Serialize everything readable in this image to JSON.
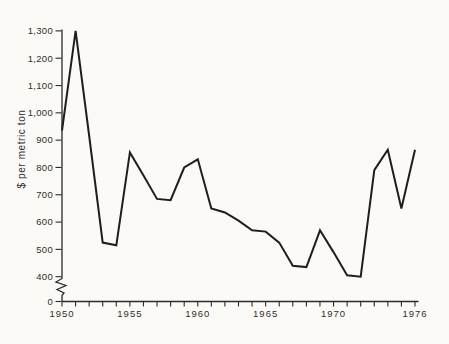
{
  "chart_data": {
    "type": "line",
    "title": "",
    "xlabel": "",
    "ylabel": "$ per metric ton",
    "x": [
      1950,
      1951,
      1952,
      1953,
      1954,
      1955,
      1956,
      1957,
      1958,
      1959,
      1960,
      1961,
      1962,
      1963,
      1964,
      1965,
      1966,
      1967,
      1968,
      1969,
      1970,
      1971,
      1972,
      1973,
      1974,
      1975,
      1976
    ],
    "values": [
      935,
      1300,
      915,
      525,
      515,
      855,
      770,
      685,
      680,
      800,
      830,
      650,
      635,
      605,
      570,
      565,
      525,
      440,
      435,
      570,
      490,
      405,
      400,
      790,
      865,
      650,
      865
    ],
    "series_name": "price",
    "xlim": [
      1950,
      1976
    ],
    "ylim_display": [
      400,
      1300
    ],
    "y_axis_break": true,
    "origin_tick_label": "0",
    "grid": false,
    "legend": "none",
    "y_ticks": [
      {
        "value": 400,
        "label": "400"
      },
      {
        "value": 500,
        "label": "500"
      },
      {
        "value": 600,
        "label": "600"
      },
      {
        "value": 700,
        "label": "700"
      },
      {
        "value": 800,
        "label": "800"
      },
      {
        "value": 900,
        "label": "900"
      },
      {
        "value": 1000,
        "label": "1,000"
      },
      {
        "value": 1100,
        "label": "1,100"
      },
      {
        "value": 1200,
        "label": "1,200"
      },
      {
        "value": 1300,
        "label": "1,300"
      }
    ],
    "x_tick_years": [
      1950,
      1951,
      1952,
      1953,
      1954,
      1955,
      1956,
      1957,
      1958,
      1959,
      1960,
      1961,
      1962,
      1963,
      1964,
      1965,
      1966,
      1967,
      1968,
      1969,
      1970,
      1971,
      1972,
      1973,
      1974,
      1975,
      1976
    ],
    "x_tick_labels": [
      {
        "year": 1950,
        "label": "1950"
      },
      {
        "year": 1955,
        "label": "1955"
      },
      {
        "year": 1960,
        "label": "1960"
      },
      {
        "year": 1965,
        "label": "1965"
      },
      {
        "year": 1970,
        "label": "1970"
      },
      {
        "year": 1976,
        "label": "1976"
      }
    ],
    "line_color": "#1e1e1e",
    "axis_color": "#2a2a2a",
    "background_color": "#fbfaf7"
  }
}
